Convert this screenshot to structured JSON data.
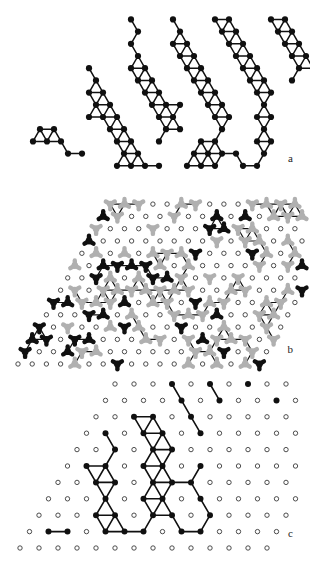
{
  "figure": {
    "background_color": "#ffffff",
    "width": 310,
    "height": 566,
    "panel_labels": {
      "a": "a",
      "b": "b",
      "c": "c"
    }
  },
  "style": {
    "node_fill_black": "#101010",
    "node_fill_gray": "#b0b0b0",
    "node_stroke_open": "#3a3a3a",
    "open_circle_fill": "#ffffff",
    "bond_color": "#101010",
    "label_color": "#1a1a1a",
    "node_radius_a": 3.1,
    "node_radius_b": 2.3,
    "node_radius_c": 3.0,
    "open_radius": 2.2,
    "bond_width_a": 1.5,
    "bond_width_b": 1.2,
    "bond_width_c": 1.6,
    "trimer_arm": 5.2,
    "trimer_hub": 3.4
  },
  "chart_data": {
    "type": "diagram",
    "panels": [
      {
        "id": "a",
        "label": "a",
        "lattice": "triangular",
        "lattice_constant_px": 14,
        "row_height_px": 12.2,
        "row_shift_px": 7,
        "origin": {
          "x": 12,
          "y": 178
        },
        "marker": "filled-circle",
        "sites": [
          [
            7,
            1
          ],
          [
            8,
            1
          ],
          [
            9,
            1
          ],
          [
            10,
            1
          ],
          [
            12,
            1
          ],
          [
            13,
            1
          ],
          [
            14,
            1
          ],
          [
            16,
            1
          ],
          [
            17,
            1
          ],
          [
            3,
            2
          ],
          [
            4,
            2
          ],
          [
            7,
            2
          ],
          [
            8,
            2
          ],
          [
            12,
            2
          ],
          [
            13,
            2
          ],
          [
            14,
            2
          ],
          [
            15,
            2
          ],
          [
            17,
            2
          ],
          [
            0,
            3
          ],
          [
            1,
            3
          ],
          [
            2,
            3
          ],
          [
            6,
            3
          ],
          [
            7,
            3
          ],
          [
            9,
            3
          ],
          [
            12,
            3
          ],
          [
            13,
            3
          ],
          [
            16,
            3
          ],
          [
            17,
            3
          ],
          [
            0,
            4
          ],
          [
            1,
            4
          ],
          [
            5,
            4
          ],
          [
            6,
            4
          ],
          [
            9,
            4
          ],
          [
            10,
            4
          ],
          [
            13,
            4
          ],
          [
            16,
            4
          ],
          [
            3,
            5
          ],
          [
            4,
            5
          ],
          [
            5,
            5
          ],
          [
            8,
            5
          ],
          [
            9,
            5
          ],
          [
            12,
            5
          ],
          [
            13,
            5
          ],
          [
            15,
            5
          ],
          [
            16,
            5
          ],
          [
            3,
            6
          ],
          [
            4,
            6
          ],
          [
            7,
            6
          ],
          [
            8,
            6
          ],
          [
            9,
            6
          ],
          [
            11,
            6
          ],
          [
            12,
            6
          ],
          [
            15,
            6
          ],
          [
            2,
            7
          ],
          [
            3,
            7
          ],
          [
            6,
            7
          ],
          [
            7,
            7
          ],
          [
            10,
            7
          ],
          [
            11,
            7
          ],
          [
            14,
            7
          ],
          [
            15,
            7
          ],
          [
            2,
            8
          ],
          [
            5,
            8
          ],
          [
            6,
            8
          ],
          [
            9,
            8
          ],
          [
            10,
            8
          ],
          [
            13,
            8
          ],
          [
            14,
            8
          ],
          [
            16,
            8
          ],
          [
            1,
            9
          ],
          [
            4,
            9
          ],
          [
            5,
            9
          ],
          [
            8,
            9
          ],
          [
            9,
            9
          ],
          [
            12,
            9
          ],
          [
            13,
            9
          ],
          [
            16,
            9
          ],
          [
            17,
            9
          ],
          [
            4,
            10
          ],
          [
            7,
            10
          ],
          [
            8,
            10
          ],
          [
            11,
            10
          ],
          [
            12,
            10
          ],
          [
            15,
            10
          ],
          [
            16,
            10
          ],
          [
            3,
            11
          ],
          [
            6,
            11
          ],
          [
            7,
            11
          ],
          [
            10,
            11
          ],
          [
            11,
            11
          ],
          [
            14,
            11
          ],
          [
            15,
            11
          ],
          [
            17,
            11
          ],
          [
            3,
            12
          ],
          [
            6,
            12
          ],
          [
            9,
            12
          ],
          [
            10,
            12
          ],
          [
            13,
            12
          ],
          [
            14,
            12
          ],
          [
            17,
            12
          ],
          [
            2,
            13
          ],
          [
            5,
            13
          ],
          [
            8,
            13
          ],
          [
            9,
            13
          ],
          [
            12,
            13
          ],
          [
            13,
            13
          ],
          [
            16,
            13
          ]
        ],
        "bonds": "nearest-neighbour pairs within each cluster"
      },
      {
        "id": "b",
        "label": "b",
        "lattice": "triangular-rhombus-patch",
        "units": [
          "black-trimer-up",
          "black-trimer-down",
          "gray-trimer-up",
          "gray-trimer-down",
          "open-circle"
        ],
        "color_black": "#101010",
        "color_gray": "#b0b0b0",
        "note": "Two sublattice species (black and gray) of three-lobed trimers, rest of sites shown as small open circles."
      },
      {
        "id": "c",
        "label": "c",
        "lattice": "triangular",
        "marker_filled": "filled-circle",
        "marker_empty": "open-circle",
        "motifs": [
          "hexagon",
          "triangle",
          "dimer",
          "monomer",
          "chain"
        ],
        "note": "Filled circles connected by bonds form a hexagonal ring with adjoining triangles; remaining lattice sites are small open circles."
      }
    ]
  }
}
